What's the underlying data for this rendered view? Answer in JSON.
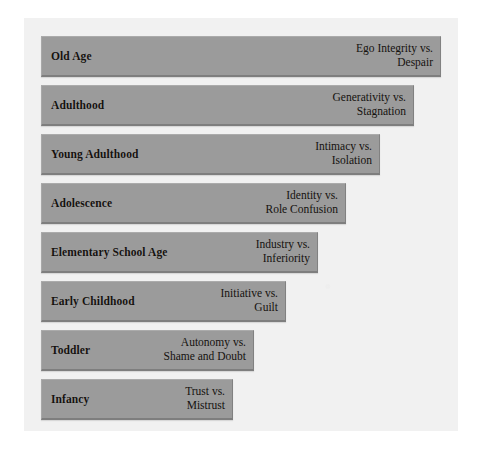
{
  "diagram": {
    "colors": {
      "page_background": "#ffffff",
      "panel_background": "#f1f1f1",
      "bar_fill": "#9b9b9b",
      "bar_shadow": "#7e7e7e",
      "text": "#15120f"
    },
    "stages": [
      {
        "name": "Old Age",
        "crisis_line1": "Ego Integrity vs.",
        "crisis_line2": "Despair",
        "bar_width": 400,
        "top": 0
      },
      {
        "name": "Adulthood",
        "crisis_line1": "Generativity vs.",
        "crisis_line2": "Stagnation",
        "bar_width": 373,
        "top": 49
      },
      {
        "name": "Young Adulthood",
        "crisis_line1": "Intimacy vs.",
        "crisis_line2": "Isolation",
        "bar_width": 339,
        "top": 98
      },
      {
        "name": "Adolescence",
        "crisis_line1": "Identity vs.",
        "crisis_line2": "Role Confusion",
        "bar_width": 305,
        "top": 147
      },
      {
        "name": "Elementary School Age",
        "crisis_line1": "Industry vs.",
        "crisis_line2": "Inferiority",
        "bar_width": 277,
        "top": 196
      },
      {
        "name": "Early Childhood",
        "crisis_line1": "Initiative vs.",
        "crisis_line2": "Guilt",
        "bar_width": 245,
        "top": 245
      },
      {
        "name": "Toddler",
        "crisis_line1": "Autonomy vs.",
        "crisis_line2": "Shame and Doubt",
        "bar_width": 213,
        "top": 294
      },
      {
        "name": "Infancy",
        "crisis_line1": "Trust vs.",
        "crisis_line2": "Mistrust",
        "bar_width": 192,
        "top": 343
      }
    ]
  }
}
